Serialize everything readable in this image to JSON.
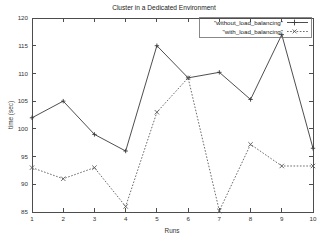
{
  "chart_data": {
    "type": "line",
    "title": "Cluster in a Dedicated Environment",
    "xlabel": "Runs",
    "ylabel": "time (sec)",
    "xlim": [
      1,
      10
    ],
    "ylim": [
      85,
      120
    ],
    "xticks": [
      "1",
      "2",
      "3",
      "4",
      "5",
      "6",
      "7",
      "8",
      "9",
      "10"
    ],
    "yticks": [
      "85",
      "90",
      "95",
      "100",
      "105",
      "110",
      "115",
      "120"
    ],
    "x": [
      1,
      2,
      3,
      4,
      5,
      6,
      7,
      8,
      9,
      10
    ],
    "grid": false,
    "legend_position": "top-right",
    "series": [
      {
        "name": "\"without_load_balancing\"",
        "style": "solid",
        "marker": "plus",
        "values": [
          102,
          105,
          99,
          96,
          115,
          109.2,
          110.2,
          105.3,
          117,
          96.5
        ]
      },
      {
        "name": "\"with_load_balancing\"",
        "style": "dotted",
        "marker": "cross",
        "values": [
          93,
          91,
          93,
          86,
          103,
          109.2,
          85.2,
          97.2,
          93.3,
          93.3
        ]
      }
    ],
    "colors": {
      "series1": "#3a3a3a",
      "series2": "#5a5a5a",
      "axis": "#4d4d4d",
      "text": "#222222",
      "background": "#ffffff"
    }
  }
}
